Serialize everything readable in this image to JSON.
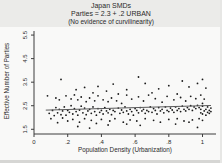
{
  "chart_data": {
    "type": "scatter",
    "title": "Japan SMDs",
    "subtitle": "Parties = 2.3 + .2 URBAN",
    "note": "(No evidence of curvilinearity)",
    "xlabel": "Population Density (Urbanization)",
    "ylabel": "Effective Number of Parties",
    "xlim": [
      0,
      1.08
    ],
    "ylim": [
      1.3,
      5.8
    ],
    "x_ticks": [
      0,
      0.2,
      0.4,
      0.6,
      0.8,
      1
    ],
    "x_tick_labels": [
      "0",
      ".2",
      ".4",
      ".6",
      ".8",
      "1"
    ],
    "y_ticks": [
      1.5,
      2.5,
      3.5,
      4.5,
      5.5
    ],
    "y_tick_labels": [
      "1.5",
      "2.5",
      "3.5",
      "4.5",
      "5.5"
    ],
    "grid": false,
    "legend": "none",
    "regression": {
      "intercept": 2.3,
      "slope": 0.2,
      "x_start": 0.07,
      "x_end": 1.05
    },
    "colors": {
      "point": "#1b1b1b",
      "reg_line": "#5a5a5a",
      "axis": "#3c3c3c",
      "tick_text": "#2a2a2a"
    },
    "points": [
      [
        0.09,
        2.18
      ],
      [
        0.11,
        2.3
      ],
      [
        0.12,
        2.08
      ],
      [
        0.13,
        2.42
      ],
      [
        0.14,
        2.2
      ],
      [
        0.15,
        2.35
      ],
      [
        0.16,
        2.12
      ],
      [
        0.17,
        2.28
      ],
      [
        0.18,
        2.45
      ],
      [
        0.19,
        2.1
      ],
      [
        0.2,
        2.3
      ],
      [
        0.21,
        2.22
      ],
      [
        0.22,
        2.5
      ],
      [
        0.23,
        2.15
      ],
      [
        0.24,
        2.38
      ],
      [
        0.25,
        2.25
      ],
      [
        0.26,
        2.1
      ],
      [
        0.27,
        2.32
      ],
      [
        0.28,
        2.48
      ],
      [
        0.29,
        2.2
      ],
      [
        0.3,
        2.4
      ],
      [
        0.31,
        2.12
      ],
      [
        0.32,
        2.28
      ],
      [
        0.33,
        2.35
      ],
      [
        0.34,
        2.18
      ],
      [
        0.35,
        2.45
      ],
      [
        0.36,
        2.25
      ],
      [
        0.37,
        2.1
      ],
      [
        0.38,
        2.38
      ],
      [
        0.39,
        2.22
      ],
      [
        0.4,
        2.3
      ],
      [
        0.41,
        2.15
      ],
      [
        0.42,
        2.42
      ],
      [
        0.43,
        2.28
      ],
      [
        0.44,
        2.2
      ],
      [
        0.45,
        2.35
      ],
      [
        0.46,
        2.12
      ],
      [
        0.47,
        2.3
      ],
      [
        0.48,
        2.25
      ],
      [
        0.5,
        2.4
      ],
      [
        0.51,
        2.18
      ],
      [
        0.52,
        2.32
      ],
      [
        0.53,
        2.22
      ],
      [
        0.54,
        2.45
      ],
      [
        0.55,
        2.28
      ],
      [
        0.56,
        2.15
      ],
      [
        0.57,
        2.35
      ],
      [
        0.58,
        2.25
      ],
      [
        0.59,
        2.1
      ],
      [
        0.6,
        2.38
      ],
      [
        0.61,
        2.3
      ],
      [
        0.62,
        2.2
      ],
      [
        0.63,
        2.42
      ],
      [
        0.64,
        2.28
      ],
      [
        0.65,
        2.35
      ],
      [
        0.66,
        2.18
      ],
      [
        0.67,
        2.3
      ],
      [
        0.68,
        2.25
      ],
      [
        0.69,
        2.45
      ],
      [
        0.7,
        2.22
      ],
      [
        0.71,
        2.38
      ],
      [
        0.72,
        2.3
      ],
      [
        0.73,
        2.15
      ],
      [
        0.74,
        2.42
      ],
      [
        0.75,
        2.28
      ],
      [
        0.76,
        2.35
      ],
      [
        0.77,
        2.2
      ],
      [
        0.78,
        2.45
      ],
      [
        0.79,
        2.3
      ],
      [
        0.8,
        2.25
      ],
      [
        0.81,
        2.4
      ],
      [
        0.82,
        2.32
      ],
      [
        0.83,
        2.22
      ],
      [
        0.84,
        2.45
      ],
      [
        0.85,
        2.3
      ],
      [
        0.86,
        2.38
      ],
      [
        0.87,
        2.25
      ],
      [
        0.88,
        2.48
      ],
      [
        0.89,
        2.35
      ],
      [
        0.9,
        2.28
      ],
      [
        0.91,
        2.42
      ],
      [
        0.92,
        2.35
      ],
      [
        0.93,
        2.5
      ],
      [
        0.94,
        2.3
      ],
      [
        0.95,
        2.45
      ],
      [
        0.96,
        2.38
      ],
      [
        0.97,
        2.52
      ],
      [
        0.98,
        2.42
      ],
      [
        0.99,
        2.35
      ],
      [
        1.0,
        2.48
      ],
      [
        0.08,
        2.92
      ],
      [
        0.13,
        2.83
      ],
      [
        0.15,
        2.75
      ],
      [
        0.19,
        2.92
      ],
      [
        0.22,
        2.79
      ],
      [
        0.24,
        2.96
      ],
      [
        0.26,
        2.75
      ],
      [
        0.28,
        2.87
      ],
      [
        0.31,
        2.67
      ],
      [
        0.33,
        2.83
      ],
      [
        0.36,
        2.71
      ],
      [
        0.38,
        2.92
      ],
      [
        0.41,
        2.75
      ],
      [
        0.44,
        2.67
      ],
      [
        0.46,
        2.83
      ],
      [
        0.49,
        2.71
      ],
      [
        0.52,
        2.6
      ],
      [
        0.55,
        2.95
      ],
      [
        0.58,
        2.78
      ],
      [
        0.62,
        2.88
      ],
      [
        0.65,
        2.7
      ],
      [
        0.68,
        2.95
      ],
      [
        0.72,
        2.8
      ],
      [
        0.76,
        2.65
      ],
      [
        0.79,
        2.9
      ],
      [
        0.83,
        2.75
      ],
      [
        0.87,
        2.85
      ],
      [
        0.9,
        2.7
      ],
      [
        0.93,
        2.9
      ],
      [
        0.96,
        2.8
      ],
      [
        0.99,
        2.95
      ],
      [
        1.01,
        2.78
      ],
      [
        0.35,
        3.05
      ],
      [
        0.5,
        3.0
      ],
      [
        0.7,
        3.05
      ],
      [
        0.85,
        3.0
      ],
      [
        0.1,
        1.95
      ],
      [
        0.14,
        1.78
      ],
      [
        0.17,
        1.98
      ],
      [
        0.2,
        1.85
      ],
      [
        0.23,
        1.92
      ],
      [
        0.27,
        1.8
      ],
      [
        0.3,
        1.95
      ],
      [
        0.34,
        1.88
      ],
      [
        0.37,
        1.75
      ],
      [
        0.4,
        1.92
      ],
      [
        0.45,
        1.85
      ],
      [
        0.48,
        1.95
      ],
      [
        0.53,
        1.8
      ],
      [
        0.57,
        1.9
      ],
      [
        0.61,
        1.85
      ],
      [
        0.66,
        1.95
      ],
      [
        0.71,
        1.88
      ],
      [
        0.75,
        1.8
      ],
      [
        0.8,
        1.92
      ],
      [
        0.85,
        1.95
      ],
      [
        0.89,
        1.85
      ],
      [
        0.94,
        1.9
      ],
      [
        0.98,
        1.95
      ],
      [
        1.0,
        1.88
      ],
      [
        0.16,
        3.62
      ],
      [
        0.25,
        3.18
      ],
      [
        0.3,
        3.28
      ],
      [
        0.38,
        3.32
      ],
      [
        0.43,
        3.12
      ],
      [
        0.47,
        3.42
      ],
      [
        0.55,
        3.18
      ],
      [
        0.62,
        3.72
      ],
      [
        0.66,
        3.45
      ],
      [
        0.74,
        3.22
      ],
      [
        0.8,
        3.35
      ],
      [
        0.88,
        3.55
      ],
      [
        0.92,
        3.3
      ],
      [
        0.97,
        3.45
      ],
      [
        1.0,
        3.62
      ],
      [
        1.02,
        3.25
      ],
      [
        0.26,
        1.62
      ],
      [
        0.33,
        1.55
      ],
      [
        0.44,
        1.68
      ],
      [
        0.55,
        1.72
      ],
      [
        0.63,
        1.67
      ],
      [
        0.84,
        1.72
      ],
      [
        0.92,
        1.8
      ],
      [
        0.97,
        1.58
      ],
      [
        0.99,
        2.2
      ],
      [
        1.0,
        2.15
      ],
      [
        1.01,
        2.28
      ],
      [
        1.02,
        2.35
      ],
      [
        1.03,
        2.22
      ],
      [
        1.03,
        2.45
      ],
      [
        1.04,
        2.3
      ],
      [
        1.04,
        2.18
      ],
      [
        1.05,
        2.4
      ],
      [
        1.05,
        2.25
      ],
      [
        1.02,
        2.1
      ],
      [
        1.0,
        2.6
      ]
    ]
  }
}
